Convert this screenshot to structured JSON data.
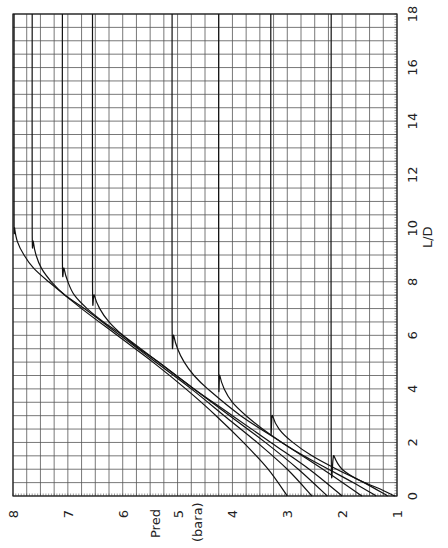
{
  "chart_data": {
    "type": "line",
    "orientation": "rotated 90 degrees: Pred on horizontal axis (reversed, 8 left to 1 right), L/D on vertical axis (0 bottom to 18 top, labels on right)",
    "title": "",
    "xlabel": "L/D",
    "ylabel": "Pred (bara)",
    "ylabel_lines": [
      "Pred",
      "(bara)"
    ],
    "xlim": [
      0,
      18
    ],
    "ylim": [
      1,
      8
    ],
    "x_ticks": [
      0,
      2,
      4,
      6,
      8,
      10,
      12,
      14,
      16,
      18
    ],
    "y_ticks": [
      1,
      2,
      3,
      4,
      5,
      6,
      7,
      8
    ],
    "grid": {
      "on": true,
      "x_minor_step": 0.5,
      "y_minor_step": 0.25
    },
    "legend": "none",
    "series": [
      {
        "name": "curve-1",
        "points": [
          [
            0,
            1.04
          ],
          [
            0.3,
            1.35
          ],
          [
            0.6,
            1.7
          ],
          [
            1.0,
            2.0
          ],
          [
            1.5,
            2.15
          ],
          [
            2.0,
            2.2
          ],
          [
            18,
            2.2
          ]
        ]
      },
      {
        "name": "curve-2",
        "points": [
          [
            0,
            1.17
          ],
          [
            0.5,
            1.6
          ],
          [
            1.0,
            2.1
          ],
          [
            1.5,
            2.55
          ],
          [
            2.0,
            2.9
          ],
          [
            2.5,
            3.15
          ],
          [
            3.0,
            3.27
          ],
          [
            3.5,
            3.3
          ],
          [
            18,
            3.3
          ]
        ]
      },
      {
        "name": "curve-3",
        "points": [
          [
            0,
            1.38
          ],
          [
            0.5,
            1.8
          ],
          [
            1.0,
            2.25
          ],
          [
            1.5,
            2.7
          ],
          [
            2.0,
            3.1
          ],
          [
            2.5,
            3.45
          ],
          [
            3.0,
            3.75
          ],
          [
            3.5,
            4.0
          ],
          [
            4.0,
            4.15
          ],
          [
            4.5,
            4.23
          ],
          [
            5.0,
            4.25
          ],
          [
            18,
            4.25
          ]
        ]
      },
      {
        "name": "curve-4",
        "points": [
          [
            0,
            1.64
          ],
          [
            1.0,
            2.35
          ],
          [
            2.0,
            3.1
          ],
          [
            3.0,
            3.85
          ],
          [
            4.0,
            4.45
          ],
          [
            4.5,
            4.7
          ],
          [
            5.0,
            4.88
          ],
          [
            5.5,
            5.0
          ],
          [
            6.0,
            5.07
          ],
          [
            6.5,
            5.1
          ],
          [
            18,
            5.1
          ]
        ]
      },
      {
        "name": "curve-5",
        "points": [
          [
            0,
            2.0
          ],
          [
            1.0,
            2.6
          ],
          [
            2.0,
            3.3
          ],
          [
            3.0,
            4.0
          ],
          [
            4.0,
            4.7
          ],
          [
            5.0,
            5.35
          ],
          [
            5.5,
            5.7
          ],
          [
            6.0,
            6.0
          ],
          [
            6.5,
            6.25
          ],
          [
            7.0,
            6.42
          ],
          [
            7.5,
            6.52
          ],
          [
            8.0,
            6.55
          ],
          [
            18,
            6.55
          ]
        ]
      },
      {
        "name": "curve-6",
        "points": [
          [
            0,
            2.27
          ],
          [
            1.0,
            2.8
          ],
          [
            2.0,
            3.4
          ],
          [
            3.0,
            4.05
          ],
          [
            4.0,
            4.7
          ],
          [
            5.0,
            5.35
          ],
          [
            6.0,
            6.0
          ],
          [
            6.5,
            6.35
          ],
          [
            7.0,
            6.65
          ],
          [
            7.5,
            6.88
          ],
          [
            8.0,
            7.0
          ],
          [
            8.5,
            7.07
          ],
          [
            9.0,
            7.1
          ],
          [
            18,
            7.1
          ]
        ]
      },
      {
        "name": "curve-7",
        "points": [
          [
            0,
            2.55
          ],
          [
            1.0,
            3.0
          ],
          [
            2.0,
            3.55
          ],
          [
            3.0,
            4.15
          ],
          [
            4.0,
            4.75
          ],
          [
            5.0,
            5.4
          ],
          [
            6.0,
            6.05
          ],
          [
            7.0,
            6.7
          ],
          [
            7.5,
            7.05
          ],
          [
            8.0,
            7.3
          ],
          [
            8.5,
            7.48
          ],
          [
            9.0,
            7.58
          ],
          [
            9.5,
            7.63
          ],
          [
            10.0,
            7.65
          ],
          [
            18,
            7.65
          ]
        ]
      },
      {
        "name": "curve-8",
        "points": [
          [
            0,
            3.0
          ],
          [
            1.0,
            3.35
          ],
          [
            2.0,
            3.8
          ],
          [
            3.0,
            4.3
          ],
          [
            4.0,
            4.85
          ],
          [
            5.0,
            5.45
          ],
          [
            6.0,
            6.1
          ],
          [
            7.0,
            6.75
          ],
          [
            8.0,
            7.35
          ],
          [
            8.5,
            7.62
          ],
          [
            9.0,
            7.8
          ],
          [
            9.5,
            7.92
          ],
          [
            10.0,
            7.97
          ],
          [
            10.5,
            7.98
          ],
          [
            18,
            7.98
          ]
        ]
      }
    ]
  },
  "axes": {
    "pred_label": "Pred",
    "pred_unit": "(bara)",
    "ld_label": "L/D"
  }
}
